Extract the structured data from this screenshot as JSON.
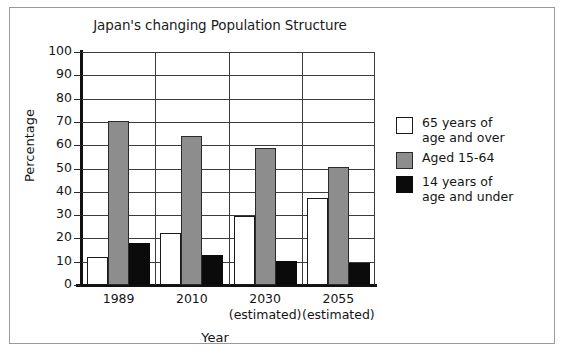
{
  "chart_data": {
    "type": "bar",
    "title": "Japan's changing Population Structure",
    "xlabel": "Year",
    "ylabel": "Percentage",
    "ylim": [
      0,
      100
    ],
    "ytick_step": 10,
    "yticks": [
      "100",
      "90",
      "80",
      "70",
      "60",
      "50",
      "40",
      "30",
      "20",
      "10",
      "0"
    ],
    "categories": [
      "1989",
      "2010",
      "2030",
      "2055"
    ],
    "category_sublabels": [
      "",
      "",
      "(estimated)",
      "(estimated)"
    ],
    "grid": "horizontal-and-group-separators",
    "legend_position": "right",
    "series": [
      {
        "name": "65 years of\nage and over",
        "color": "#ffffff",
        "values": [
          12,
          22.5,
          29.5,
          37.5
        ]
      },
      {
        "name": "Aged 15-64",
        "color": "#8d8d8d",
        "values": [
          70.5,
          64,
          59,
          50.5
        ]
      },
      {
        "name": "14 years of\nage and under",
        "color": "#0b0b0b",
        "values": [
          18,
          13,
          10.5,
          9.5
        ]
      }
    ]
  },
  "legend": {
    "entries": [
      {
        "label": "65 years of\nage and over",
        "swatch": "white"
      },
      {
        "label": "Aged 15-64",
        "swatch": "gray"
      },
      {
        "label": "14 years of\nage and under",
        "swatch": "black"
      }
    ]
  }
}
